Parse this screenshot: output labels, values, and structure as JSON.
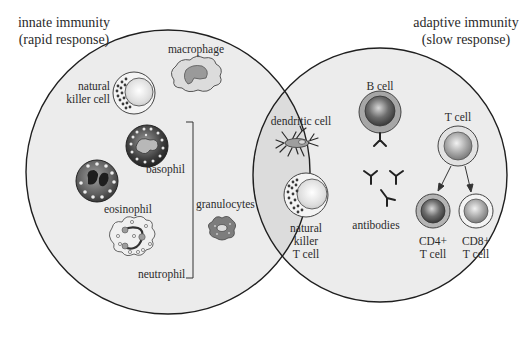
{
  "diagram": {
    "type": "venn",
    "colors": {
      "background": "#ffffff",
      "circle_fill": "#ebebeb",
      "overlap_fill": "#dcdcdc",
      "outline": "#1f1f1f",
      "dark_cell": "#5a5a5a",
      "medium_cell": "#8e8e8e",
      "light_cell": "#cfcfcf"
    },
    "innate": {
      "title": "innate immunity",
      "subtitle": "(rapid response)"
    },
    "adaptive": {
      "title": "adaptive immunity",
      "subtitle": "(slow response)"
    },
    "cells": {
      "macrophage": "macrophage",
      "nk_line1": "natural",
      "nk_line2": "killer cell",
      "basophil": "basophil",
      "eosinophil": "eosinophil",
      "neutrophil": "neutrophil",
      "granulocytes": "granulocytes",
      "dendritic": "dendritic cell",
      "nkt_line1": "natural",
      "nkt_line2": "killer",
      "nkt_line3": "T cell",
      "bcell": "B cell",
      "antibodies": "antibodies",
      "tcell": "T cell",
      "cd4_line1": "CD4+",
      "cd4_line2": "T cell",
      "cd8_line1": "CD8+",
      "cd8_line2": "T cell"
    }
  }
}
